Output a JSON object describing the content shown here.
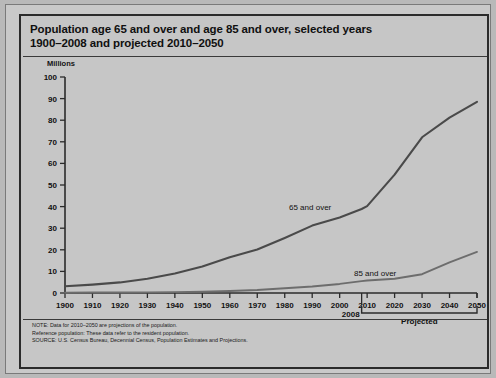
{
  "figure": {
    "title_line1": "Population age 65 and over and age 85 and over, selected years",
    "title_line2": "1900–2008 and projected 2010–2050",
    "unit_label": "Millions",
    "projected_label": "Projected",
    "marker_2008": "2008",
    "notes": [
      "NOTE: Data for 2010–2050 are projections of the population.",
      "Reference population: These data refer to the resident population.",
      "SOURCE: U.S. Census Bureau, Decennial Census, Population Estimates and Projections."
    ]
  },
  "chart_data": {
    "type": "line",
    "title": "Population age 65 and over and age 85 and over, selected years 1900–2008 and projected 2010–2050",
    "xlabel": "",
    "ylabel": "Millions",
    "xlim": [
      1900,
      2050
    ],
    "ylim": [
      0,
      100
    ],
    "ytick_step": 10,
    "xtick_step": 10,
    "grid": false,
    "legend": "inline-annotations",
    "xticks": [
      1900,
      1910,
      1920,
      1930,
      1940,
      1950,
      1960,
      1970,
      1980,
      1990,
      2000,
      2010,
      2020,
      2030,
      2040,
      2050
    ],
    "yticks": [
      0,
      10,
      20,
      30,
      40,
      50,
      60,
      70,
      80,
      90,
      100
    ],
    "x": [
      1900,
      1910,
      1920,
      1930,
      1940,
      1950,
      1960,
      1970,
      1980,
      1990,
      2000,
      2008,
      2010,
      2020,
      2030,
      2040,
      2050
    ],
    "series": [
      {
        "name": "65 and over",
        "label": "65 and over",
        "color": "#4a4a4a",
        "values": [
          3.1,
          3.9,
          4.9,
          6.6,
          9.0,
          12.3,
          16.6,
          20.1,
          25.5,
          31.2,
          35.0,
          38.9,
          40.2,
          54.8,
          72.1,
          81.2,
          88.5
        ]
      },
      {
        "name": "85 and over",
        "label": "85 and over",
        "color": "#6d6d6d",
        "values": [
          0.1,
          0.2,
          0.2,
          0.3,
          0.4,
          0.6,
          0.9,
          1.4,
          2.2,
          3.0,
          4.2,
          5.5,
          5.8,
          6.6,
          8.7,
          14.2,
          19.0
        ]
      }
    ]
  }
}
